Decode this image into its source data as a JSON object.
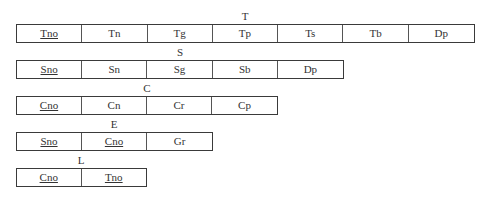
{
  "groups": [
    {
      "label": "T",
      "cells": [
        {
          "text": "Tno",
          "underline": true
        },
        {
          "text": "Tn"
        },
        {
          "text": "Tg"
        },
        {
          "text": "Tp"
        },
        {
          "text": "Ts"
        },
        {
          "text": "Tb"
        },
        {
          "text": "Dp"
        }
      ]
    },
    {
      "label": "S",
      "cells": [
        {
          "text": "Sno",
          "underline": true
        },
        {
          "text": "Sn"
        },
        {
          "text": "Sg"
        },
        {
          "text": "Sb"
        },
        {
          "text": "Dp"
        }
      ]
    },
    {
      "label": "C",
      "cells": [
        {
          "text": "Cno",
          "underline": true
        },
        {
          "text": "Cn"
        },
        {
          "text": "Cr"
        },
        {
          "text": "Cp"
        }
      ]
    },
    {
      "label": "E",
      "cells": [
        {
          "text": "Sno",
          "underline": true
        },
        {
          "text": "Cno",
          "underline": true
        },
        {
          "text": "Gr"
        }
      ]
    },
    {
      "label": "L",
      "cells": [
        {
          "text": "Cno",
          "underline": true
        },
        {
          "text": "Tno",
          "underline": true
        }
      ]
    }
  ]
}
